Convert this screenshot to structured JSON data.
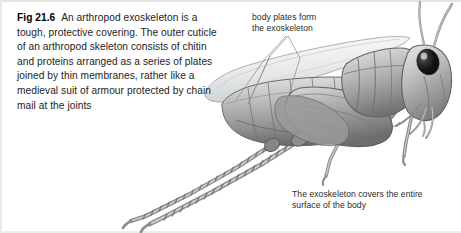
{
  "figure": {
    "caption": {
      "label": "Fig 21.6",
      "text": "An arthropod exoskeleton is a tough, protective covering. The outer cuticle of an arthropod skeleton consists of chitin and proteins arranged as a series of plates joined by thin membranes, rather like a medieval suit of armour protected by chain mail at the joints"
    },
    "annotations": [
      {
        "id": "body-plates",
        "text": "body plates form\nthe exoskeleton"
      },
      {
        "id": "exoskeleton-covers",
        "text": "The exoskeleton covers the entire\nsurface of the body"
      }
    ],
    "illustration": {
      "subject": "grasshopper-lateral-view",
      "style": "grayscale-airbrush-drawing",
      "parts": [
        "antenna-upper",
        "antenna-lower",
        "compound-eye",
        "head",
        "mouthparts",
        "pronotum",
        "thorax",
        "forewing",
        "abdomen-segments",
        "hind-femur",
        "hind-tibia-spined",
        "middle-leg",
        "foreleg"
      ]
    },
    "colors": {
      "background": "#ffffff",
      "text": "#1b1b1b",
      "annotation_text": "#2a2a2a",
      "body_light": "#d2d2d2",
      "body_mid": "#a8a8a8",
      "body_dark": "#787878",
      "outline": "#5a5a5a",
      "eye": "#121212",
      "wing": "#e6e8e8",
      "leader_line": "#8d8d8d"
    }
  }
}
